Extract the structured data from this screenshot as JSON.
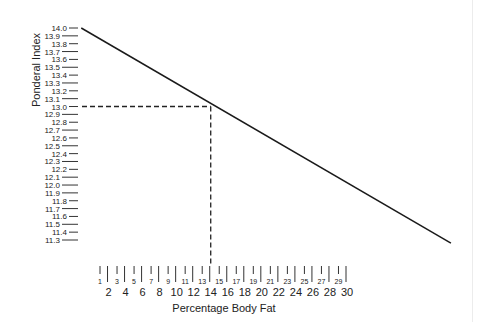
{
  "chart_data": {
    "type": "line",
    "title": "",
    "xlabel": "Percentage Body Fat",
    "ylabel": "Ponderal Index",
    "y_ticks": [
      "14.0",
      "13.9",
      "13.8",
      "13.7",
      "13.6",
      "13.5",
      "13.4",
      "13.3",
      "13.2",
      "13.1",
      "13.0",
      "12.9",
      "12.8",
      "12.7",
      "12.6",
      "12.5",
      "12.4",
      "12.3",
      "12.2",
      "12.1",
      "12.0",
      "11.9",
      "11.8",
      "11.7",
      "11.6",
      "11.5",
      "11.4",
      "11.3"
    ],
    "x_ticks_major": [
      "2",
      "4",
      "6",
      "8",
      "10",
      "12",
      "14",
      "16",
      "18",
      "20",
      "22",
      "24",
      "26",
      "28",
      "30"
    ],
    "x_ticks_minor": [
      "1",
      "3",
      "5",
      "7",
      "9",
      "11",
      "13",
      "15",
      "17",
      "19",
      "21",
      "23",
      "25",
      "27",
      "29"
    ],
    "ylim": [
      11.3,
      14.0
    ],
    "xlim": [
      1,
      30
    ],
    "series": [
      {
        "name": "Ponderal Index vs Percentage Body Fat",
        "points": [
          {
            "x": -1.2,
            "y": 14.0
          },
          {
            "x": 42.2,
            "y": 11.26
          }
        ]
      }
    ],
    "annotation": {
      "type": "dashed-crosshair",
      "x": 14,
      "y": 13.0
    },
    "grid": false,
    "colors": {
      "line": "#1a1a1a",
      "text": "#222222"
    }
  }
}
